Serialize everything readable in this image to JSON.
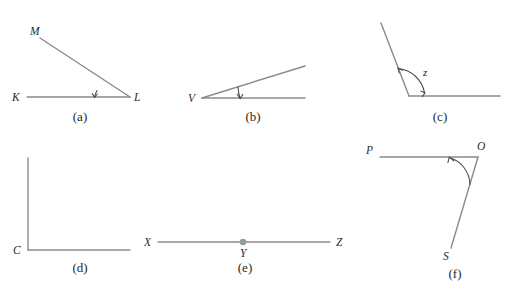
{
  "figure": {
    "top_bleed_text": "",
    "colors": {
      "ray": "#8a8a8a",
      "arc": "#4a4a4a",
      "dot": "#9a9a9a",
      "label": "#2b2b2b",
      "caption": "#1f1f1f",
      "background": "#ffffff"
    },
    "panels": [
      {
        "id": "a",
        "caption": "(a)",
        "labels": {
          "vertex": "L",
          "ray1_end": "M",
          "ray2_end": "K"
        },
        "angle_label": "",
        "has_arc": true,
        "has_dot": false
      },
      {
        "id": "b",
        "caption": "(b)",
        "labels": {
          "vertex": "V",
          "ray1_end": "",
          "ray2_end": ""
        },
        "angle_label": "",
        "has_arc": true,
        "has_dot": false
      },
      {
        "id": "c",
        "caption": "(c)",
        "labels": {
          "vertex": "",
          "ray1_end": "",
          "ray2_end": ""
        },
        "angle_label": "z",
        "has_arc": true,
        "has_dot": false
      },
      {
        "id": "d",
        "caption": "(d)",
        "labels": {
          "vertex": "C",
          "ray1_end": "",
          "ray2_end": ""
        },
        "angle_label": "",
        "has_arc": false,
        "has_dot": false
      },
      {
        "id": "e",
        "caption": "(e)",
        "labels": {
          "vertex": "Y",
          "ray1_end": "X",
          "ray2_end": "Z"
        },
        "angle_label": "",
        "has_arc": false,
        "has_dot": true
      },
      {
        "id": "f",
        "caption": "(f)",
        "labels": {
          "vertex": "O",
          "ray1_end": "P",
          "ray2_end": "S"
        },
        "angle_label": "",
        "has_arc": true,
        "has_dot": false
      }
    ]
  }
}
